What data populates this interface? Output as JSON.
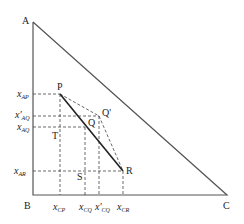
{
  "vertices": {
    "A": "A",
    "B": "B",
    "C": "C"
  },
  "points": {
    "P": "P",
    "Q": "Q",
    "Q_prime": "Q'",
    "R": "R",
    "S": "S",
    "T": "T"
  },
  "y_axis_labels": {
    "x_AP": {
      "main": "x",
      "sub": "AP"
    },
    "x_prime_AQ": {
      "main": "x'",
      "sub": "AQ"
    },
    "x_AQ": {
      "main": "x",
      "sub": "AQ"
    },
    "x_AR": {
      "main": "x",
      "sub": "AR"
    }
  },
  "x_axis_labels": {
    "x_CP": {
      "main": "x",
      "sub": "CP"
    },
    "x_CQ": {
      "main": "x",
      "sub": "CQ"
    },
    "x_prime_CQ": {
      "main": "x'",
      "sub": "CQ"
    },
    "x_CR": {
      "main": "x",
      "sub": "CR"
    }
  },
  "colors": {
    "triangle": "#555555",
    "tie_line": "#222222",
    "dashed": "#444444"
  }
}
